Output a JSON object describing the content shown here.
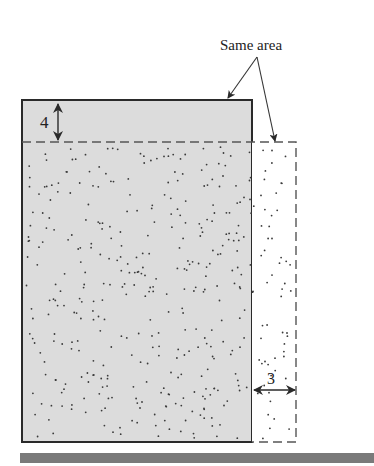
{
  "diagram": {
    "annotation": "Same area",
    "top_dimension": "4",
    "side_dimension": "3",
    "colors": {
      "fill_gray": "#dcdcdc",
      "stroke": "#2a2a2a",
      "dot": "#3a3a3a",
      "bottom_bar": "#7a7a7a"
    },
    "shapes": {
      "solid_rect": {
        "x": 22,
        "y": 100,
        "width": 230,
        "height": 342
      },
      "dashed_rect": {
        "x": 22,
        "y": 142,
        "width": 274,
        "height": 300
      }
    }
  }
}
